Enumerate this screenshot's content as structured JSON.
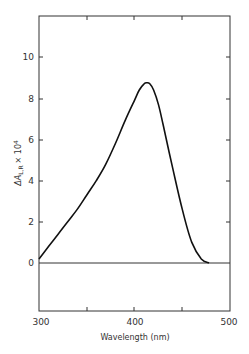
{
  "chart_data": {
    "type": "line",
    "title": "",
    "xlabel": "Wavelength (nm)",
    "ylabel": "ΔA L,R × 10⁴",
    "xlim": [
      300,
      500
    ],
    "ylim": [
      -2.4,
      12
    ],
    "x_ticks": [
      300,
      400,
      500
    ],
    "x_minor_ticks": [
      350,
      450
    ],
    "y_ticks": [
      0,
      2,
      4,
      6,
      8,
      10
    ],
    "grid": false,
    "legend": null,
    "zero_line": true,
    "series": [
      {
        "name": "ΔA L,R",
        "x": [
          300,
          310,
          320,
          330,
          340,
          350,
          360,
          370,
          380,
          390,
          400,
          405,
          410,
          413,
          416,
          420,
          425,
          430,
          440,
          450,
          460,
          470,
          478
        ],
        "y": [
          0.2,
          0.8,
          1.4,
          2.0,
          2.6,
          3.3,
          4.0,
          4.8,
          5.8,
          6.9,
          7.9,
          8.4,
          8.7,
          8.75,
          8.7,
          8.4,
          7.7,
          6.7,
          4.6,
          2.6,
          1.0,
          0.2,
          0.0
        ]
      }
    ]
  },
  "labels": {
    "x_axis_title": "Wavelength (nm)",
    "y_axis_title_main": "ΔA",
    "y_axis_title_sub": "L,R",
    "y_axis_title_mult": "× 10",
    "y_axis_title_exp": "4",
    "x_tick_300": "300",
    "x_tick_400": "400",
    "x_tick_500": "500",
    "y_tick_0": "0",
    "y_tick_2": "2",
    "y_tick_4": "4",
    "y_tick_6": "6",
    "y_tick_8": "8",
    "y_tick_10": "10"
  }
}
